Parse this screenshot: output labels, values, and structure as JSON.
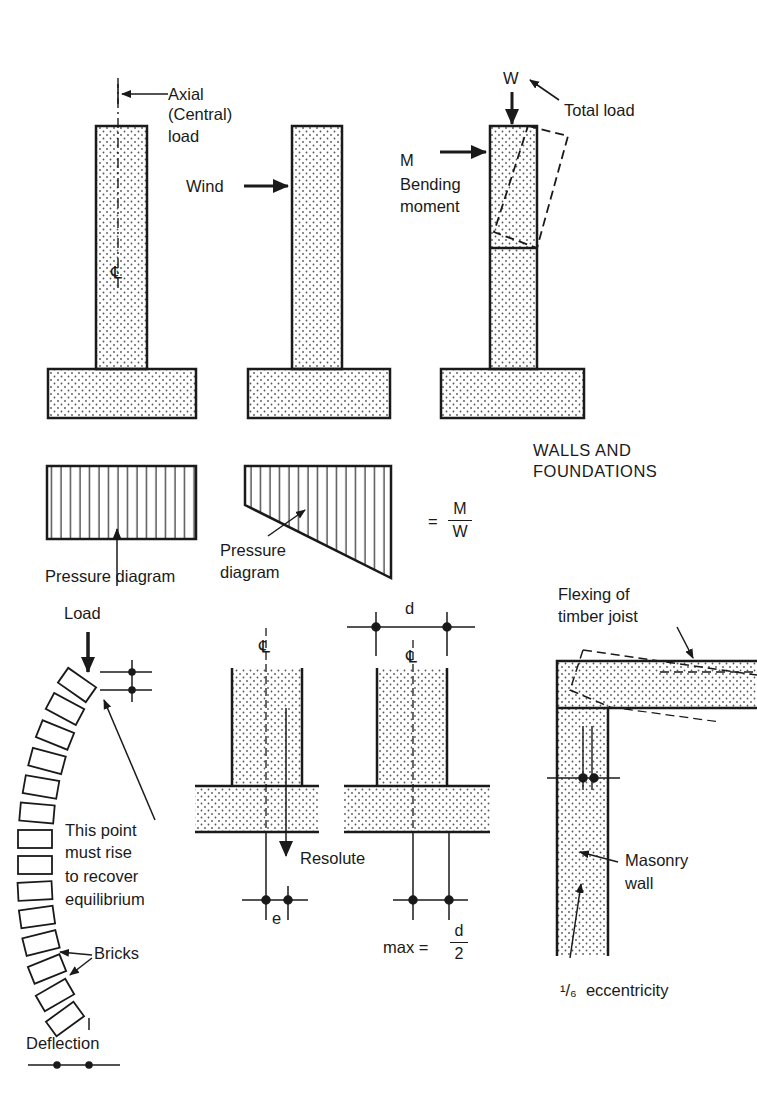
{
  "title": "WALLS AND FOUNDATIONS",
  "colors": {
    "ink": "#1a1a1a",
    "fill": "#ffffff",
    "stipple": "#555555"
  },
  "top_row": {
    "wall1": {
      "label_lines": [
        "Axial",
        "(Central)",
        "load"
      ],
      "centerline_symbol": "℄"
    },
    "wall2": {
      "label": "Wind"
    },
    "wall3": {
      "load_symbol": "W",
      "load_label": "Total load",
      "moment_symbol": "M",
      "moment_label_lines": [
        "Bending",
        "moment"
      ]
    }
  },
  "pressure": {
    "left_label": "Pressure diagram",
    "right_label_lines": [
      "Pressure",
      "diagram"
    ],
    "formula": {
      "prefix": "=",
      "numerator": "M",
      "denominator": "W"
    }
  },
  "bottom_left": {
    "load_label": "Load",
    "note_lines": [
      "This point",
      "must rise",
      "to recover",
      "equilibrium"
    ],
    "bricks_label": "Bricks",
    "deflection_label": "Deflection"
  },
  "bottom_middle": {
    "centerline_symbol": "℄",
    "resolute_label": "Resolute",
    "e_label": "e",
    "d_label": "d",
    "max_formula": {
      "prefix": "max =",
      "numerator": "d",
      "denominator": "2"
    }
  },
  "bottom_right": {
    "joist_label_lines": [
      "Flexing of",
      "timber joist"
    ],
    "wall_label_lines": [
      "Masonry",
      "wall"
    ],
    "eccentricity_label": "¹/₆  eccentricity"
  }
}
